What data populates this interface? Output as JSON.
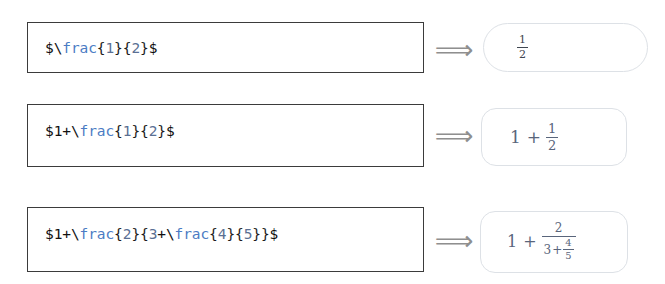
{
  "page": {
    "background": "#ffffff",
    "arrow_glyph": "⟹",
    "arrow_name": "implies-double-arrow",
    "colors": {
      "input_border": "#3b3b3b",
      "output_border": "#dde1e6",
      "source_text": "#111111",
      "source_command": "#4b7cc4",
      "source_number": "#5a6f93",
      "rendered_plain": "#3f4650",
      "rendered_blue": "#59657b",
      "arrow": "#8f8f8f"
    }
  },
  "rows": [
    {
      "id": "row-1",
      "source_raw": "$\\frac{1}{2}$",
      "tokens": {
        "dollar_open": "$",
        "backslash": "\\",
        "command": "frac",
        "brace_1": "{",
        "num_1": "1",
        "brace_2": "}",
        "brace_3": "{",
        "num_2": "2",
        "brace_4": "}",
        "dollar_close": "$"
      },
      "rendered": {
        "description": "one half",
        "numerator": "1",
        "denominator": "2"
      }
    },
    {
      "id": "row-2",
      "source_raw": "$1+\\frac{1}{2}$",
      "tokens": {
        "dollar_open": "$",
        "lead_num": "1",
        "plus": "+",
        "backslash": "\\",
        "command": "frac",
        "brace_1": "{",
        "num_1": "1",
        "brace_2": "}",
        "brace_3": "{",
        "num_2": "2",
        "brace_4": "}",
        "dollar_close": "$"
      },
      "rendered": {
        "description": "one plus one half",
        "lead": "1",
        "operator": "+",
        "numerator": "1",
        "denominator": "2"
      }
    },
    {
      "id": "row-3",
      "source_raw": "$1+\\frac{2}{3+\\frac{4}{5}}$",
      "tokens": {
        "dollar_open": "$",
        "lead_num": "1",
        "plus": "+",
        "backslash_outer": "\\",
        "command_outer": "frac",
        "brace_1": "{",
        "num_outer": "2",
        "brace_2": "}",
        "brace_3": "{",
        "den_lead": "3",
        "den_plus": "+",
        "backslash_inner": "\\",
        "command_inner": "frac",
        "brace_4": "{",
        "num_inner": "4",
        "brace_5": "}",
        "brace_6": "{",
        "den_inner": "5",
        "brace_7": "}",
        "brace_8": "}",
        "dollar_close": "$"
      },
      "rendered": {
        "description": "one plus two over three plus four fifths",
        "lead": "1",
        "operator": "+",
        "numerator": "2",
        "den_lead": "3",
        "den_operator": "+",
        "inner_numerator": "4",
        "inner_denominator": "5"
      }
    }
  ]
}
